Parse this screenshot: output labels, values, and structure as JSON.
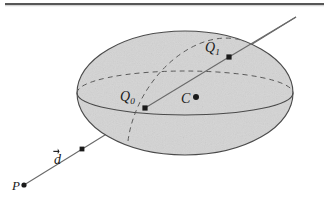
{
  "figure": {
    "caption_absent": true,
    "background_color": "#ffffff",
    "sphere": {
      "fill_color": "#d4d4d4",
      "outline_color": "#4a4a4a",
      "dashed_color": "#5a5a5a",
      "center_x": 185,
      "center_y": 93,
      "radius_x": 108,
      "radius_y": 62,
      "equator_ry": 22
    },
    "ray": {
      "color": "#6a6a6a",
      "start_x": 24,
      "start_y": 185,
      "end_x": 296,
      "end_y": 17
    },
    "points": [
      {
        "id": "P",
        "label": "P",
        "subscript": "",
        "marker": "round",
        "marker_x": 24,
        "marker_y": 185,
        "label_x": 12,
        "label_y": 179,
        "font_size": 13
      },
      {
        "id": "d-tick",
        "label": "",
        "subscript": "",
        "marker": "square",
        "marker_x": 82,
        "marker_y": 149,
        "label_x": 0,
        "label_y": 0,
        "font_size": 13
      },
      {
        "id": "Q0",
        "label": "Q",
        "subscript": "0",
        "marker": "square",
        "marker_x": 145,
        "marker_y": 108,
        "label_x": 120,
        "label_y": 90,
        "font_size": 14
      },
      {
        "id": "C",
        "label": "C",
        "subscript": "",
        "marker": "round",
        "marker_x": 196,
        "marker_y": 97,
        "label_x": 181,
        "label_y": 92,
        "font_size": 14
      },
      {
        "id": "Q1",
        "label": "Q",
        "subscript": "1",
        "marker": "square",
        "marker_x": 229,
        "marker_y": 57,
        "label_x": 205,
        "label_y": 41,
        "font_size": 14
      }
    ],
    "vector_label": {
      "id": "d",
      "label": "d",
      "has_overarrow": true,
      "label_x": 54,
      "label_y": 153,
      "font_size": 14
    },
    "top_rule": {
      "color": "#3a3a3a",
      "x": 5,
      "y": 3,
      "width": 319,
      "height": 2
    }
  }
}
